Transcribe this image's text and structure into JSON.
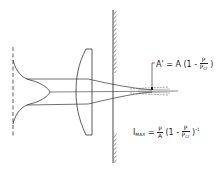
{
  "diagram": {
    "colors": {
      "line": "#333333",
      "background": "#ffffff"
    },
    "elements": [
      "gaussian-profile",
      "lens",
      "aperture-wall",
      "converging-rays",
      "focal-spot",
      "area-pointer"
    ],
    "annotation_area": {
      "lhs": "A'",
      "equals": "=",
      "rhs_prefix": "A (1 -",
      "frac_num": "P",
      "frac_den": "P",
      "frac_den_sub": "cr",
      "suffix": ")"
    },
    "annotation_intensity": {
      "lhs": "I",
      "lhs_sub": "MAX",
      "equals": "=",
      "frac1_num": "P",
      "frac1_den": "A",
      "mid": "(1 -",
      "frac2_num": "P",
      "frac2_den": "P",
      "frac2_den_sub": "cr",
      "suffix": ")",
      "exponent": "-1"
    }
  }
}
